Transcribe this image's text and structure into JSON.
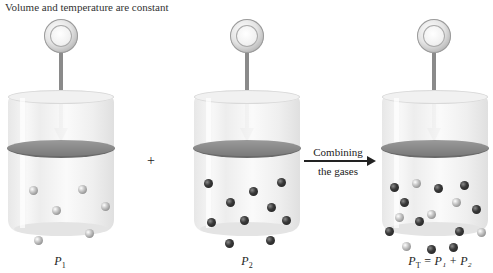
{
  "title": "Volume and temperature are constant",
  "operators": {
    "plus": "+"
  },
  "transition": {
    "line1": "Combining",
    "line2": "the gases",
    "arrow": "right-arrow"
  },
  "containers": [
    {
      "id": "gas1",
      "label_main": "P",
      "label_sub": "1",
      "label_suffix": "",
      "molecules": {
        "light": 6,
        "dark": 0
      }
    },
    {
      "id": "gas2",
      "label_main": "P",
      "label_sub": "2",
      "label_suffix": "",
      "molecules": {
        "light": 0,
        "dark": 11
      }
    },
    {
      "id": "mixture",
      "label_main": "P",
      "label_sub": "T",
      "label_suffix": " = P₁ + P₂",
      "molecules": {
        "light": 6,
        "dark": 11
      }
    }
  ],
  "colors": {
    "piston": "#7a7a7a",
    "rod": "#8a8a8a",
    "dark_molecule": "#2a2a2a",
    "light_molecule": "#c9c9c9"
  }
}
